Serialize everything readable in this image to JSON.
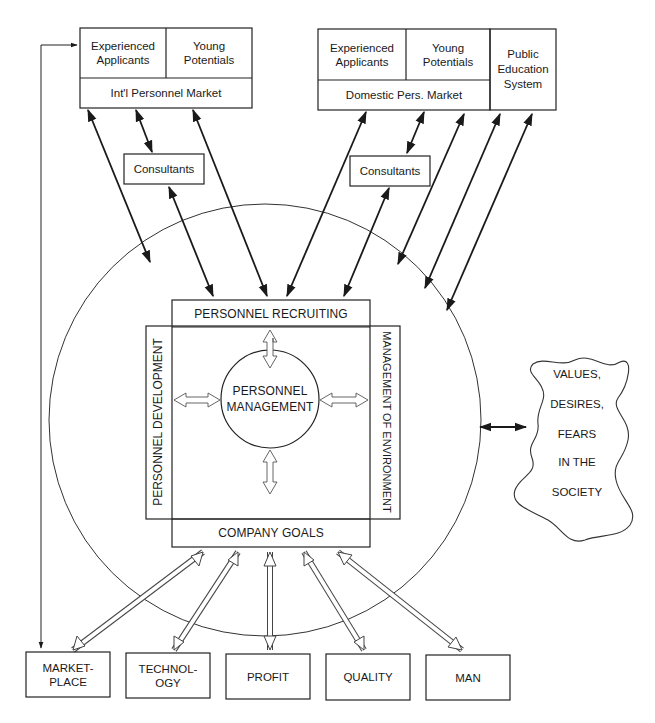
{
  "diagram": {
    "international_market": {
      "cells": [
        "Experienced Applicants",
        "Young Potentials"
      ],
      "cell_lines": [
        [
          "Experienced",
          "Applicants"
        ],
        [
          "Young",
          "Potentials"
        ]
      ],
      "title": "Int'l Personnel Market",
      "consultants": "Consultants"
    },
    "domestic_market": {
      "cell_lines": [
        [
          "Experienced",
          "Applicants"
        ],
        [
          "Young",
          "Potentials"
        ]
      ],
      "title": "Domestic Pers. Market",
      "consultants": "Consultants"
    },
    "public_education": {
      "lines": [
        "Public",
        "Education",
        "System"
      ]
    },
    "core": {
      "recruiting": "PERSONNEL RECRUITING",
      "development": "PERSONNEL DEVELOPMENT",
      "environment": "MANAGEMENT OF ENVIRONMENT",
      "goals": "COMPANY GOALS",
      "center_lines": [
        "PERSONNEL",
        "MANAGEMENT"
      ]
    },
    "society": {
      "lines": [
        "VALUES,",
        "DESIRES,",
        "FEARS",
        "IN THE",
        "SOCIETY"
      ]
    },
    "factors": [
      {
        "lines": [
          "MARKET-",
          "PLACE"
        ]
      },
      {
        "lines": [
          "TECHNOL-",
          "OGY"
        ]
      },
      {
        "lines": [
          "PROFIT"
        ]
      },
      {
        "lines": [
          "QUALITY"
        ]
      },
      {
        "lines": [
          "MAN"
        ]
      }
    ],
    "colors": {
      "line": "#1a1a1a",
      "background": "#ffffff",
      "hollow_arrow": "#444444"
    }
  }
}
